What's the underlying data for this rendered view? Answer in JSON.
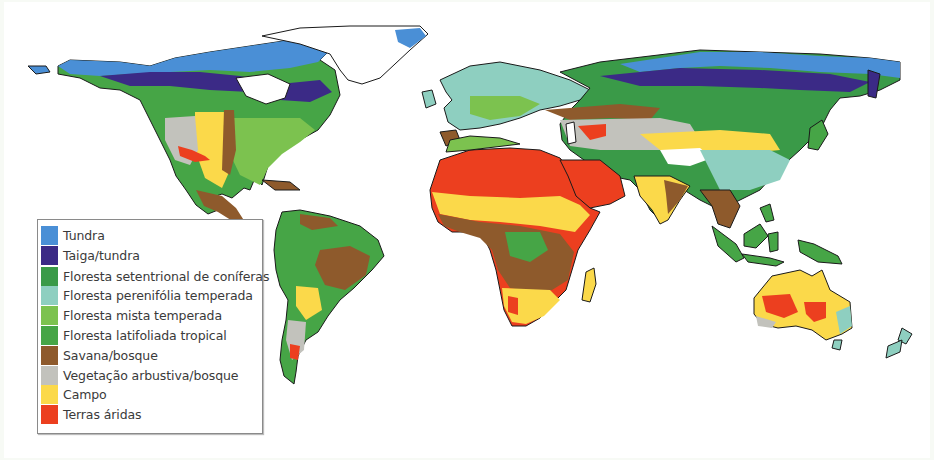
{
  "map": {
    "title": "Biomas do mundo",
    "regions": [
      {
        "name": "north-america"
      },
      {
        "name": "greenland"
      },
      {
        "name": "south-america"
      },
      {
        "name": "europe"
      },
      {
        "name": "africa"
      },
      {
        "name": "asia"
      },
      {
        "name": "australia"
      },
      {
        "name": "southeast-asia-islands"
      },
      {
        "name": "new-zealand"
      },
      {
        "name": "madagascar"
      }
    ]
  },
  "legend": {
    "items": [
      {
        "label": "Tundra",
        "color": "#4a8fd6"
      },
      {
        "label": "Taiga/tundra",
        "color": "#3b2a86"
      },
      {
        "label": "Floresta setentrional de coníferas",
        "color": "#3a9a48"
      },
      {
        "label": "Floresta perenifólia temperada",
        "color": "#8ecfc0"
      },
      {
        "label": "Floresta mista temperada",
        "color": "#7cc24f"
      },
      {
        "label": "Floresta latifoliada tropical",
        "color": "#46a546"
      },
      {
        "label": "Savana/bosque",
        "color": "#8e5a2c"
      },
      {
        "label": "Vegetação arbustiva/bosque",
        "color": "#c2c2bc"
      },
      {
        "label": "Campo",
        "color": "#fbd94a"
      },
      {
        "label": "Terras áridas",
        "color": "#ec3f1f"
      }
    ]
  }
}
